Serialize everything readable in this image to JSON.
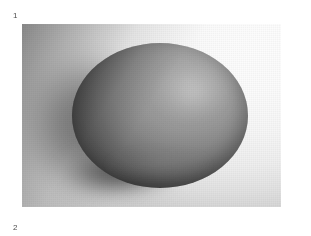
{
  "figure": {
    "label_top": "1",
    "label_bottom": "2",
    "panel": {
      "subject": "egg",
      "description": "Grayscale photograph of a single egg resting on a flat surface, lit from the upper right, casting a soft shadow to the left",
      "colors": {
        "backdrop_light": "#fdfdfd",
        "backdrop_shadow": "#8a8a8a",
        "egg_highlight": "#b4b4b4",
        "egg_midtone": "#8a8a8a",
        "egg_shadow": "#2a2a2a",
        "page_background": "#ffffff",
        "label_color": "#4d4d4d"
      },
      "geometry": {
        "panel_left": 22,
        "panel_top": 24,
        "panel_width": 259,
        "panel_height": 183,
        "egg_left": 72,
        "egg_top": 43,
        "egg_width": 176,
        "egg_height": 145
      }
    }
  }
}
